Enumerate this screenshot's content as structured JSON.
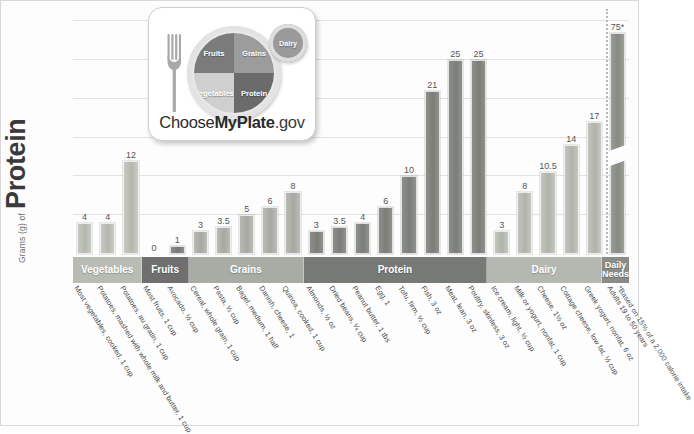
{
  "yaxis": {
    "small": "Grams (g) of",
    "big": "Protein"
  },
  "logo": {
    "fruits": "Fruits",
    "grains": "Grains",
    "vegetables": "Vegetables",
    "protein": "Protein",
    "dairy": "Dairy",
    "brand_1": "Choose",
    "brand_2": "MyPlate",
    "brand_3": ".gov"
  },
  "chart_data": {
    "type": "bar",
    "title": "",
    "xlabel": "",
    "ylabel": "Grams (g) of Protein",
    "ylim": [
      0,
      30
    ],
    "grid": true,
    "gridlines": [
      5,
      10,
      15,
      20,
      25,
      30
    ],
    "legend": "none",
    "note": "*Based on 15% of a 2,000 calorie intake",
    "categories": [
      "Most vegetables, cooked, 1 cup",
      "Potatoes, mashed with whole milk and butter, 1 cup",
      "Potatoes, au gratin, 1 cup",
      "Most fruits, 1 cup",
      "Avocado, ½ cup",
      "Cereal, whole grain, 1 cup",
      "Pasta, ½ cup",
      "Bagel, medium, 1 half",
      "Danish, cheese, 1",
      "Quinoa, cooked, 1 cup",
      "Almonds, ½ oz",
      "Dried beans, ¼ cup",
      "Peanut butter, 1 tbs",
      "Egg, 1",
      "Tofu, firm, ½ cup",
      "Fish, 3 oz",
      "Meat, lean, 3 oz",
      "Poultry, skinless, 3 oz",
      "Ice cream, light, ½ cup",
      "Milk or yogurt, nonfat, 1 cup",
      "Cheese, 1½ oz",
      "Cottage cheese, low fat, ½ cup",
      "Greek yogurt, nonfat, 6 oz",
      "Adults 19 to 50 years"
    ],
    "values": [
      4,
      4,
      12,
      0,
      1,
      3,
      3.5,
      5,
      6,
      8,
      3,
      3.5,
      4,
      6,
      10,
      21,
      25,
      25,
      3,
      8,
      10.5,
      14,
      17,
      75
    ],
    "value_labels": [
      "4",
      "4",
      "12",
      "0",
      "1",
      "3",
      "3.5",
      "5",
      "6",
      "8",
      "3",
      "3.5",
      "4",
      "6",
      "10",
      "21",
      "25",
      "25",
      "3",
      "8",
      "10.5",
      "14",
      "17",
      "75*"
    ],
    "groups": [
      {
        "label": "Vegetables",
        "key": "veg",
        "count": 3
      },
      {
        "label": "Fruits",
        "key": "fruit",
        "count": 2
      },
      {
        "label": "Grains",
        "key": "grain",
        "count": 5
      },
      {
        "label": "Protein",
        "key": "prot",
        "count": 8
      },
      {
        "label": "Dairy",
        "key": "dairy",
        "count": 5
      },
      {
        "label": "Daily\nNeeds",
        "key": "needs",
        "count": 1
      }
    ],
    "axis_break": {
      "bar_index": 23,
      "displayed_value": 75,
      "drawn_as": 28.5
    }
  }
}
